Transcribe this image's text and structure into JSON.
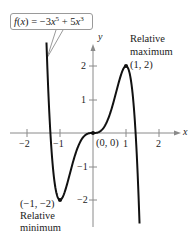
{
  "chart_data": {
    "type": "line",
    "title": "",
    "function_label": "f(x) = −3x^5 + 5x^3",
    "function_parts": {
      "fname": "f",
      "var": "x",
      "c1": "−3",
      "e1": "5",
      "op": "+",
      "c2": "5",
      "e2": "3"
    },
    "xlabel": "x",
    "ylabel": "y",
    "xlim": [
      -2.5,
      2.6
    ],
    "ylim": [
      -2.8,
      2.6
    ],
    "xticks": [
      -2,
      -1,
      1,
      2
    ],
    "yticks": [
      -2,
      -1,
      1,
      2
    ],
    "xtick_labels": [
      "−2",
      "−1",
      "1",
      "2"
    ],
    "ytick_labels": [
      "−2",
      "−1",
      "1",
      "2"
    ],
    "grid": false,
    "legend": null,
    "series": [
      {
        "name": "f(x) = −3x^5 + 5x^3",
        "x_range": [
          -1.41,
          1.41
        ],
        "x": [
          -1.41,
          -1.35,
          -1.3,
          -1.25,
          -1.2,
          -1.15,
          -1.1,
          -1.05,
          -1.0,
          -0.9,
          -0.8,
          -0.7,
          -0.6,
          -0.5,
          -0.4,
          -0.3,
          -0.2,
          -0.1,
          0.0,
          0.1,
          0.2,
          0.3,
          0.4,
          0.5,
          0.6,
          0.7,
          0.8,
          0.9,
          1.0,
          1.05,
          1.1,
          1.15,
          1.2,
          1.25,
          1.3,
          1.35,
          1.41
        ],
        "y": [
          2.6,
          1.51,
          0.15,
          -0.53,
          -1.0,
          -1.4,
          -1.72,
          -1.9,
          -2.0,
          -1.87,
          -1.58,
          -1.21,
          -0.85,
          -0.53,
          -0.29,
          -0.13,
          -0.04,
          -0.005,
          0.0,
          0.005,
          0.04,
          0.13,
          0.29,
          0.53,
          0.85,
          1.21,
          1.58,
          1.87,
          2.0,
          1.9,
          1.72,
          1.4,
          1.0,
          0.53,
          -0.15,
          -1.51,
          -2.6
        ]
      }
    ],
    "annotations": [
      {
        "text": "(0, 0)",
        "x": 0,
        "y": 0
      },
      {
        "text": "Relative maximum (1, 2)",
        "x": 1,
        "y": 2
      },
      {
        "text": "(−1, −2) Relative minimum",
        "x": -1,
        "y": -2
      }
    ],
    "points": [
      {
        "label": "(1, 2)",
        "x": 1,
        "y": 2,
        "kind": "Relative maximum"
      },
      {
        "label": "(−1, −2)",
        "x": -1,
        "y": -2,
        "kind": "Relative minimum"
      },
      {
        "label": "(0, 0)",
        "x": 0,
        "y": 0,
        "kind": "Inflection"
      }
    ]
  },
  "labels": {
    "origin": "(0, 0)",
    "max_line1": "Relative",
    "max_line2": "maximum",
    "max_point": "(1, 2)",
    "min_point": "(−1, −2)",
    "min_line1": "Relative",
    "min_line2": "minimum",
    "x_axis": "x",
    "y_axis": "y"
  },
  "colors": {
    "curve": "#111111",
    "axis": "#8a8a8a",
    "text": "#222222",
    "callout_border": "#9a9a9a"
  }
}
